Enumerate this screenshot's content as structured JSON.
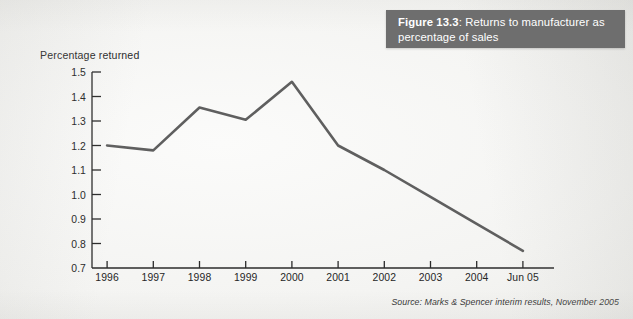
{
  "figure": {
    "number_label": "Figure 13.3",
    "separator": ": ",
    "caption": "Returns to manufacturer as percentage of sales"
  },
  "source": {
    "text": "Source: Marks & Spencer interim results, November 2005"
  },
  "colors": {
    "banner_background": "#6e6e6e",
    "banner_text": "#ffffff",
    "line": "#5f5f5f",
    "axis": "#2b2b2b",
    "page_background": "#f4f4f2"
  },
  "chart_data": {
    "type": "line",
    "title": "Returns to manufacturer as percentage of sales",
    "xlabel": "",
    "ylabel": "Percentage returned",
    "categories": [
      "1996",
      "1997",
      "1998",
      "1999",
      "2000",
      "2001",
      "2002",
      "2003",
      "2004",
      "Jun 05"
    ],
    "values": [
      1.2,
      1.18,
      1.355,
      1.305,
      1.46,
      1.2,
      1.1,
      0.99,
      0.88,
      0.77
    ],
    "ylim": [
      0.7,
      1.5
    ],
    "ytick_values": [
      1.5,
      1.4,
      1.3,
      1.2,
      1.1,
      1.0,
      0.9,
      0.8,
      0.7
    ],
    "ytick_labels": [
      "1.5",
      "1.4",
      "1.3",
      "1.2",
      "1.1",
      "1.0",
      "0.9",
      "0.8",
      "0.7"
    ],
    "grid": false,
    "legend": "none",
    "series": [
      {
        "name": "Percentage returned",
        "values": [
          1.2,
          1.18,
          1.355,
          1.305,
          1.46,
          1.2,
          1.1,
          0.99,
          0.88,
          0.77
        ]
      }
    ]
  }
}
